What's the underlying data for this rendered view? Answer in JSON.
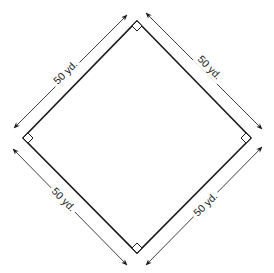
{
  "diagram": {
    "colors": {
      "ink": "#1a1a1a",
      "background": "#ffffff"
    },
    "vertices": {
      "top": [
        137,
        21
      ],
      "left": [
        23,
        138
      ],
      "right": [
        251,
        138
      ],
      "bottom": [
        137,
        253
      ]
    },
    "sides": [
      {
        "id": "top-left",
        "label": "50 yd.",
        "length_value": 50,
        "unit": "yd."
      },
      {
        "id": "top-right",
        "label": "50 yd.",
        "length_value": 50,
        "unit": "yd."
      },
      {
        "id": "bottom-left",
        "label": "50 yd.",
        "length_value": 50,
        "unit": "yd."
      },
      {
        "id": "bottom-right",
        "label": "50 yd.",
        "length_value": 50,
        "unit": "yd."
      }
    ],
    "right_angle_markers": [
      "top",
      "left",
      "right",
      "bottom"
    ]
  }
}
